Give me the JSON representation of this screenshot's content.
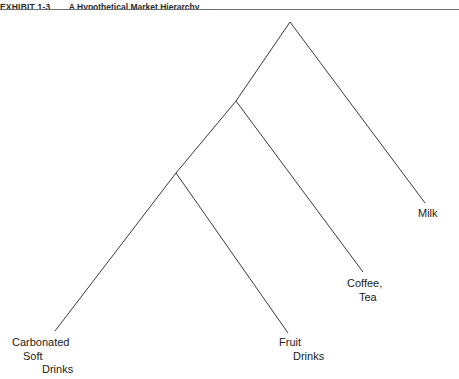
{
  "header": {
    "exhibit_label": "EXHIBIT 1-3",
    "title": "A Hypothetical Market Hierarchy",
    "rule_color": "#6e6e6e"
  },
  "diagram": {
    "type": "hierarchy-tree",
    "line_color": "#3a3a3a",
    "line_width": 1,
    "background": "#ffffff",
    "nodes": [
      {
        "name": "apex",
        "x": 290,
        "y": 22
      },
      {
        "name": "node-2",
        "x": 236,
        "y": 101
      },
      {
        "name": "node-3",
        "x": 176,
        "y": 173
      }
    ],
    "branches": [
      {
        "name": "apex-to-milk",
        "x1": 290,
        "y1": 22,
        "x2": 425,
        "y2": 203
      },
      {
        "name": "apex-to-node-2",
        "x1": 290,
        "y1": 22,
        "x2": 236,
        "y2": 101
      },
      {
        "name": "node-2-to-coffee-tea",
        "x1": 236,
        "y1": 101,
        "x2": 363,
        "y2": 272
      },
      {
        "name": "node-2-to-node-3",
        "x1": 236,
        "y1": 101,
        "x2": 176,
        "y2": 173
      },
      {
        "name": "node-3-to-fruit-drinks",
        "x1": 176,
        "y1": 173,
        "x2": 288,
        "y2": 333
      },
      {
        "name": "node-3-to-carbonated",
        "x1": 176,
        "y1": 173,
        "x2": 55,
        "y2": 331
      }
    ],
    "leaves": [
      {
        "name": "carbonated-soft-drinks",
        "lines": [
          "Carbonated",
          "Soft",
          "Drinks"
        ]
      },
      {
        "name": "fruit-drinks",
        "lines": [
          "Fruit",
          "Drinks"
        ]
      },
      {
        "name": "coffee-tea",
        "lines": [
          "Coffee,",
          "Tea"
        ]
      },
      {
        "name": "milk",
        "lines": [
          "Milk"
        ]
      }
    ]
  }
}
